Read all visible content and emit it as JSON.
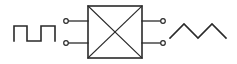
{
  "diagram": {
    "type": "block-diagram",
    "colors": {
      "stroke": "#2a2a2a",
      "background": "#ffffff",
      "terminal_fill": "#ffffff"
    },
    "input_signal": {
      "waveform": "square-wave",
      "points": "14,41 14,26 27,26 27,41 41,41 41,26 55,26 55,41"
    },
    "block": {
      "x": 88,
      "y": 6,
      "width": 54,
      "height": 52,
      "label": ""
    },
    "input_terminals": [
      {
        "cx": 66,
        "cy": 21,
        "lead_x1": 68,
        "lead_x2": 88
      },
      {
        "cx": 66,
        "cy": 43,
        "lead_x1": 68,
        "lead_x2": 88
      }
    ],
    "output_terminals": [
      {
        "cx": 163,
        "cy": 21,
        "lead_x1": 142,
        "lead_x2": 161
      },
      {
        "cx": 163,
        "cy": 43,
        "lead_x1": 142,
        "lead_x2": 161
      }
    ],
    "output_signal": {
      "waveform": "triangle-wave",
      "points": "170,38 184,24 198,38 212,24 226,38"
    }
  }
}
